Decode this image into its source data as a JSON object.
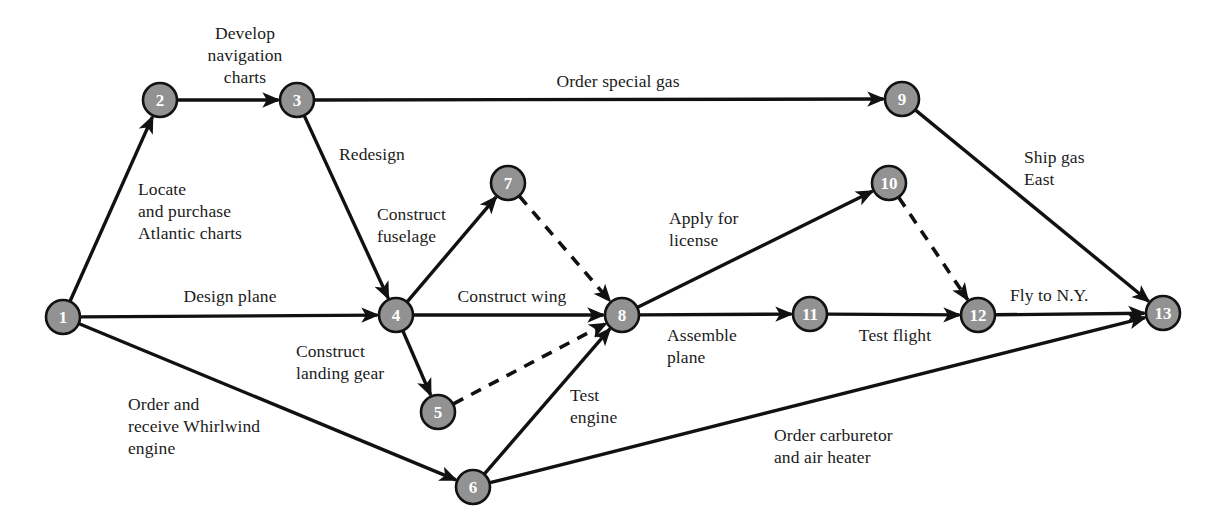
{
  "diagram": {
    "type": "activity-on-arrow-network",
    "node_fill_color": "#929292",
    "node_stroke_color": "#121212",
    "node_label_color": "#ffffff",
    "edge_color": "#111111",
    "background_color": "#ffffff",
    "nodes": [
      {
        "id": "1",
        "label": "1",
        "cx": 63,
        "cy": 317,
        "r": 17
      },
      {
        "id": "2",
        "label": "2",
        "cx": 160,
        "cy": 100,
        "r": 17
      },
      {
        "id": "3",
        "label": "3",
        "cx": 297,
        "cy": 100,
        "r": 17
      },
      {
        "id": "4",
        "label": "4",
        "cx": 396,
        "cy": 315,
        "r": 17
      },
      {
        "id": "5",
        "label": "5",
        "cx": 438,
        "cy": 412,
        "r": 17
      },
      {
        "id": "6",
        "label": "6",
        "cx": 473,
        "cy": 487,
        "r": 17
      },
      {
        "id": "7",
        "label": "7",
        "cx": 508,
        "cy": 183,
        "r": 17
      },
      {
        "id": "8",
        "label": "8",
        "cx": 622,
        "cy": 315,
        "r": 17
      },
      {
        "id": "9",
        "label": "9",
        "cx": 902,
        "cy": 99,
        "r": 17
      },
      {
        "id": "10",
        "label": "10",
        "cx": 889,
        "cy": 183,
        "r": 17
      },
      {
        "id": "11",
        "label": "11",
        "cx": 810,
        "cy": 314,
        "r": 17
      },
      {
        "id": "12",
        "label": "12",
        "cx": 978,
        "cy": 315,
        "r": 17
      },
      {
        "id": "13",
        "label": "13",
        "cx": 1163,
        "cy": 313,
        "r": 17
      }
    ],
    "edges": [
      {
        "from": "1",
        "to": "2",
        "style": "solid",
        "label": "Locate\nand purchase\nAtlantic charts"
      },
      {
        "from": "2",
        "to": "3",
        "style": "solid",
        "label": "Develop\nnavigation\ncharts"
      },
      {
        "from": "3",
        "to": "9",
        "style": "solid",
        "label": "Order special gas"
      },
      {
        "from": "3",
        "to": "4",
        "style": "solid",
        "label": "Redesign"
      },
      {
        "from": "1",
        "to": "4",
        "style": "solid",
        "label": "Design plane"
      },
      {
        "from": "1",
        "to": "6",
        "style": "solid",
        "label": "Order and\nreceive Whirlwind\nengine"
      },
      {
        "from": "4",
        "to": "7",
        "style": "solid",
        "label": "Construct\nfuselage"
      },
      {
        "from": "4",
        "to": "8",
        "style": "solid",
        "label": "Construct wing"
      },
      {
        "from": "4",
        "to": "5",
        "style": "solid",
        "label": "Construct\nlanding gear"
      },
      {
        "from": "7",
        "to": "8",
        "style": "dashed",
        "label": ""
      },
      {
        "from": "5",
        "to": "8",
        "style": "dashed",
        "label": ""
      },
      {
        "from": "6",
        "to": "8",
        "style": "solid",
        "label": "Test\nengine"
      },
      {
        "from": "8",
        "to": "10",
        "style": "solid",
        "label": "Apply for\nlicense"
      },
      {
        "from": "8",
        "to": "11",
        "style": "solid",
        "label": "Assemble\nplane"
      },
      {
        "from": "11",
        "to": "12",
        "style": "solid",
        "label": "Test flight"
      },
      {
        "from": "10",
        "to": "12",
        "style": "dashed",
        "label": ""
      },
      {
        "from": "12",
        "to": "13",
        "style": "solid",
        "label": "Fly to N.Y."
      },
      {
        "from": "9",
        "to": "13",
        "style": "solid",
        "label": "Ship gas\nEast"
      },
      {
        "from": "6",
        "to": "13",
        "style": "solid",
        "label": "Order carburetor\nand air heater"
      }
    ],
    "labels": [
      {
        "key": "develop_navigation_charts",
        "text": "Develop\nnavigation\ncharts",
        "x": 185,
        "y": 22,
        "w": 120,
        "align": "center"
      },
      {
        "key": "order_special_gas",
        "text": "Order special gas",
        "x": 528,
        "y": 70,
        "w": 180,
        "align": "center"
      },
      {
        "key": "locate_purchase_charts",
        "text": "Locate\nand purchase\nAtlantic charts",
        "x": 138,
        "y": 178,
        "w": 180,
        "align": "left"
      },
      {
        "key": "redesign",
        "text": "Redesign",
        "x": 339,
        "y": 143,
        "w": 100,
        "align": "left"
      },
      {
        "key": "ship_gas_east",
        "text": "Ship gas\nEast",
        "x": 1024,
        "y": 146,
        "w": 110,
        "align": "left"
      },
      {
        "key": "construct_fuselage",
        "text": "Construct\nfuselage",
        "x": 377,
        "y": 203,
        "w": 110,
        "align": "left"
      },
      {
        "key": "apply_for_license",
        "text": "Apply for\nlicense",
        "x": 669,
        "y": 207,
        "w": 110,
        "align": "left"
      },
      {
        "key": "design_plane",
        "text": "Design plane",
        "x": 160,
        "y": 285,
        "w": 140,
        "align": "center"
      },
      {
        "key": "construct_wing",
        "text": "Construct wing",
        "x": 432,
        "y": 285,
        "w": 160,
        "align": "center"
      },
      {
        "key": "fly_to_ny",
        "text": "Fly to N.Y.",
        "x": 1010,
        "y": 284,
        "w": 100,
        "align": "left"
      },
      {
        "key": "assemble_plane",
        "text": "Assemble\nplane",
        "x": 667,
        "y": 324,
        "w": 110,
        "align": "left"
      },
      {
        "key": "test_flight",
        "text": "Test flight",
        "x": 845,
        "y": 324,
        "w": 100,
        "align": "center"
      },
      {
        "key": "construct_landing_gear",
        "text": "Construct\nlanding gear",
        "x": 296,
        "y": 340,
        "w": 130,
        "align": "left"
      },
      {
        "key": "test_engine",
        "text": "Test\nengine",
        "x": 570,
        "y": 384,
        "w": 90,
        "align": "left"
      },
      {
        "key": "order_receive_whirlwind",
        "text": "Order and\nreceive Whirlwind\nengine",
        "x": 128,
        "y": 393,
        "w": 200,
        "align": "left"
      },
      {
        "key": "order_carburetor_air_heater",
        "text": "Order carburetor\nand air heater",
        "x": 774,
        "y": 424,
        "w": 180,
        "align": "left"
      }
    ]
  }
}
